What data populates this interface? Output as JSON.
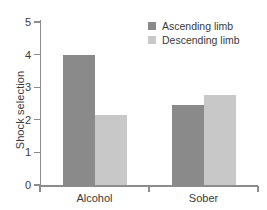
{
  "chart_data": {
    "type": "bar",
    "title": "",
    "subtitle": "",
    "xlabel": "",
    "ylabel": "Shock selection",
    "categories": [
      "Alcohol",
      "Sober"
    ],
    "series": [
      {
        "name": "Ascending limb",
        "color": "#8a8a8a",
        "values": [
          4.0,
          2.45
        ]
      },
      {
        "name": "Descending limb",
        "color": "#c8c8c8",
        "values": [
          2.15,
          2.75
        ]
      }
    ],
    "ylim": [
      0,
      5
    ],
    "ytick_labels": [
      "0",
      "1",
      "2",
      "3",
      "4",
      "5"
    ],
    "ytick_values": [
      0,
      1,
      2,
      3,
      4,
      5
    ],
    "grid": false,
    "legend_position": "top-right",
    "axis_color": "#8c8c8c",
    "text_color": "#3a3a3a",
    "background_color": "#ffffff"
  }
}
